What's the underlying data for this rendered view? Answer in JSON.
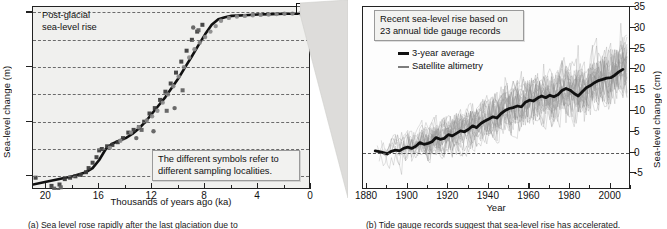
{
  "figure": {
    "panel_a_caption": "(a)  Sea level rose rapidly after the last glaciation due to",
    "panel_b_caption": "(b)  Tide gauge records suggest that sea-level rise has accelerated."
  },
  "panel_a": {
    "label": "(a)",
    "note_title": "Post-glacial\nsea-level rise",
    "callout": "The different symbols refer to\ndifferent sampling localities.",
    "zoom_box_name": "zoom-region-box"
  },
  "panel_b": {
    "label": "(b)",
    "callout": "Recent sea-level rise based on\n23 annual tide gauge records",
    "legend": [
      {
        "label": "3-year average",
        "style": "thick",
        "color": "#111111"
      },
      {
        "label": "Satellite altimetry",
        "style": "thin",
        "color": "#7d7d7d"
      }
    ]
  },
  "chart_data": [
    {
      "id": "post-glacial-sea-level",
      "type": "scatter",
      "title": "Post-glacial sea-level rise",
      "xlabel": "Thousands of years ago (ka)",
      "ylabel": "Sea-level change (m)",
      "xlim": [
        21,
        0
      ],
      "ylim": [
        -130,
        4
      ],
      "x_ticks": [
        20,
        16,
        12,
        8,
        4,
        0
      ],
      "y_ticks": [
        0,
        -40,
        -80,
        -120
      ],
      "gridlines_y": [
        0,
        -20,
        -40,
        -60,
        -80,
        -100,
        -120
      ],
      "grid": true,
      "x_minor_step": 2,
      "legend_position": "none",
      "series": [
        {
          "name": "Fitted sea-level curve",
          "type": "line",
          "color": "#111111",
          "x": [
            21.0,
            20.0,
            19.0,
            18.0,
            17.0,
            16.5,
            16.0,
            15.5,
            15.0,
            14.5,
            14.0,
            13.5,
            13.0,
            12.5,
            12.0,
            11.5,
            11.0,
            10.5,
            10.0,
            9.5,
            9.0,
            8.5,
            8.0,
            7.5,
            7.0,
            6.5,
            6.0,
            5.0,
            4.0,
            3.0,
            2.0,
            1.0,
            0.0
          ],
          "y": [
            -126,
            -124,
            -122,
            -120,
            -117,
            -114,
            -108,
            -100,
            -96,
            -94,
            -92,
            -89,
            -85,
            -80,
            -74,
            -68,
            -62,
            -55,
            -48,
            -40,
            -32,
            -24,
            -16,
            -9,
            -5,
            -3.5,
            -2.5,
            -2,
            -1.5,
            -1.2,
            -1,
            -0.8,
            -0.5
          ]
        },
        {
          "name": "Sampling locality A (dark squares)",
          "type": "scatter",
          "marker": "square",
          "color": "#3a3a3a",
          "x": [
            20.8,
            19.6,
            19.0,
            18.6,
            18.2,
            17.8,
            17.4,
            17.0,
            16.8,
            16.5,
            16.2,
            16.0,
            15.8,
            15.4,
            15.0,
            14.6,
            14.2,
            13.8,
            13.4,
            13.0,
            12.6,
            12.2,
            11.8,
            11.4,
            11.0,
            10.6,
            10.2,
            9.8,
            9.4,
            9.0,
            8.6,
            8.2
          ],
          "y": [
            -121,
            -127,
            -126,
            -122,
            -121,
            -120,
            -119,
            -117,
            -114,
            -110,
            -106,
            -101,
            -100,
            -98,
            -97,
            -95,
            -92,
            -88,
            -86,
            -84,
            -80,
            -74,
            -70,
            -64,
            -58,
            -52,
            -44,
            -36,
            -28,
            -20,
            -14,
            -9
          ]
        },
        {
          "name": "Sampling locality B (mid-gray circles)",
          "type": "scatter",
          "marker": "circle",
          "color": "#8a8a8a",
          "x": [
            15.2,
            14.4,
            13.6,
            13.0,
            12.4,
            12.0,
            11.6,
            11.2,
            10.8,
            10.4,
            10.0,
            9.6,
            9.2,
            8.8,
            8.4,
            8.0,
            7.6,
            7.2,
            6.8,
            6.2,
            5.6,
            5.0,
            4.4,
            3.8,
            3.2,
            2.6,
            2.0,
            1.4,
            0.8,
            0.3
          ],
          "y": [
            -99,
            -94,
            -88,
            -84,
            -79,
            -76,
            -72,
            -66,
            -60,
            -54,
            -47,
            -40,
            -33,
            -27,
            -22,
            -18,
            -14,
            -10,
            -6,
            -4,
            -3,
            -2.5,
            -2,
            -1.8,
            -1.5,
            -1.2,
            -1,
            -0.8,
            -0.6,
            -0.4
          ]
        },
        {
          "name": "Sampling locality C (scattered outliers)",
          "type": "scatter",
          "marker": "mixed",
          "color": "#5d5d5d",
          "x": [
            19.4,
            19.1,
            18.9,
            13.2,
            12.8,
            11.9,
            10.9,
            10.3,
            9.7,
            8.9,
            8.5
          ],
          "y": [
            -129,
            -130,
            -128,
            -92,
            -86,
            -87,
            -72,
            -70,
            -57,
            -11,
            -13
          ]
        }
      ]
    },
    {
      "id": "recent-sea-level-tide-gauges",
      "type": "line",
      "title": "Recent sea-level rise based on 23 annual tide gauge records",
      "xlabel": "Year",
      "ylabel": "Sea-level change (cm)",
      "xlim": [
        1878,
        2010
      ],
      "ylim": [
        -9,
        35
      ],
      "x_ticks": [
        1880,
        1900,
        1920,
        1940,
        1960,
        1980,
        2000
      ],
      "y_ticks": [
        -5,
        0,
        5,
        10,
        15,
        20,
        25,
        30,
        35
      ],
      "zero_reference_line": 0,
      "grid": false,
      "legend_position": "upper-left",
      "series": [
        {
          "name": "3-year average",
          "color": "#111111",
          "x": [
            1884,
            1886,
            1888,
            1890,
            1892,
            1894,
            1896,
            1898,
            1900,
            1902,
            1904,
            1906,
            1908,
            1910,
            1912,
            1914,
            1916,
            1918,
            1920,
            1922,
            1924,
            1926,
            1928,
            1930,
            1932,
            1934,
            1936,
            1938,
            1940,
            1942,
            1944,
            1946,
            1948,
            1950,
            1952,
            1954,
            1956,
            1958,
            1960,
            1962,
            1964,
            1966,
            1968,
            1970,
            1972,
            1974,
            1976,
            1978,
            1980,
            1982,
            1984,
            1986,
            1988,
            1990,
            1992,
            1994,
            1996,
            1998,
            2000,
            2002,
            2004,
            2006
          ],
          "y": [
            0.4,
            0.2,
            0.0,
            -0.3,
            0.3,
            0.6,
            0.4,
            1.0,
            1.3,
            1.0,
            1.5,
            2.4,
            2.0,
            2.2,
            2.6,
            3.6,
            3.2,
            3.4,
            4.3,
            4.0,
            4.6,
            5.2,
            5.0,
            5.6,
            6.4,
            6.0,
            7.0,
            7.6,
            8.1,
            8.6,
            8.3,
            9.4,
            10.1,
            10.6,
            10.8,
            11.2,
            11.0,
            12.1,
            12.6,
            12.4,
            13.1,
            13.6,
            13.2,
            13.8,
            13.4,
            13.9,
            14.9,
            15.4,
            15.0,
            14.2,
            13.6,
            14.6,
            15.6,
            16.1,
            16.8,
            17.3,
            17.6,
            17.9,
            18.0,
            18.6,
            19.4,
            20.0
          ]
        },
        {
          "name": "Satellite altimetry / individual tide gauge records",
          "color": "#8e8e8e",
          "description": "23 noisy annual records, spread roughly ±8 cm about the 3-year average",
          "count": 23
        }
      ]
    }
  ]
}
